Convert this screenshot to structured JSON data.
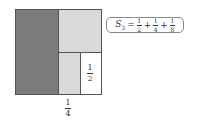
{
  "diagram": {
    "regions": [
      {
        "name": "half",
        "fraction": "1/2",
        "color": "#7b7b7b"
      },
      {
        "name": "quarter",
        "fraction": "1/4",
        "color": "#d9d9d9"
      },
      {
        "name": "eighth",
        "fraction": "1/8",
        "color": "#d9d9d9"
      },
      {
        "name": "remaining",
        "fraction": "1/8",
        "color": "#ffffff"
      }
    ],
    "labels": {
      "half": {
        "num": "1",
        "den": "2"
      },
      "quarter": {
        "num": "1",
        "den": "4"
      }
    },
    "formula": {
      "lhs": "S",
      "lhs_sub": "3",
      "equals": "=",
      "plus": "+",
      "terms": [
        {
          "num": "1",
          "den": "2"
        },
        {
          "num": "1",
          "den": "4"
        },
        {
          "num": "1",
          "den": "8"
        }
      ]
    }
  }
}
